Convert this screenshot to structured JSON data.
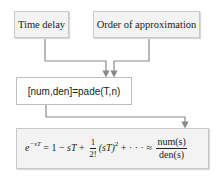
{
  "diagram": {
    "inputs": [
      {
        "label": "Time delay"
      },
      {
        "label": "Order of approximation"
      }
    ],
    "function_call": {
      "label": "[num,den]=pade(T,n)"
    },
    "formula": {
      "lhs_base": "e",
      "lhs_exp": "−sT",
      "eq": "=",
      "term1": "1",
      "minus": "−",
      "term2": "sT",
      "plus1": "+",
      "frac1_num": "1",
      "frac1_den": "2!",
      "term3": "(sT)",
      "term3_exp": "2",
      "plus2": "+",
      "dots": "· · ·",
      "approx": "≈",
      "result_num": "num(s)",
      "result_den": "den(s)"
    },
    "colors": {
      "box_fill": "#f3f3f3",
      "box_border": "#c9c9c9",
      "connector": "#8a8a8a"
    }
  }
}
